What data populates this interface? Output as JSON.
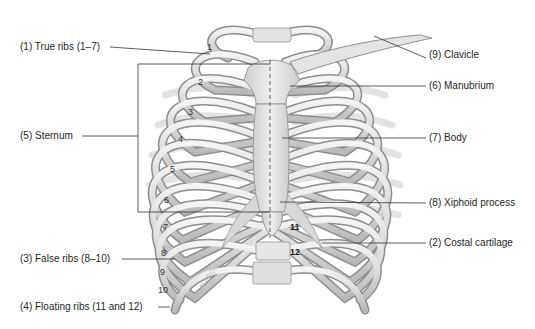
{
  "figure": {
    "labels_left": [
      {
        "id": "true-ribs",
        "text": "(1) True ribs (1–7)"
      },
      {
        "id": "sternum",
        "text": "(5) Sternum"
      },
      {
        "id": "false-ribs",
        "text": "(3) False ribs (8–10)"
      },
      {
        "id": "floating-ribs",
        "text": "(4) Floating ribs (11 and 12)"
      }
    ],
    "labels_right": [
      {
        "id": "clavicle",
        "text": "(9) Clavicle"
      },
      {
        "id": "manubrium",
        "text": "(6) Manubrium"
      },
      {
        "id": "body",
        "text": "(7) Body"
      },
      {
        "id": "xiphoid-process",
        "text": "(8) Xiphoid process"
      },
      {
        "id": "costal-cartilage",
        "text": "(2) Costal cartilage"
      }
    ],
    "rib_numbers": [
      "1",
      "2",
      "3",
      "4",
      "5",
      "6",
      "7",
      "8",
      "9",
      "10",
      "11",
      "12"
    ],
    "watermark": "M.MARON"
  }
}
